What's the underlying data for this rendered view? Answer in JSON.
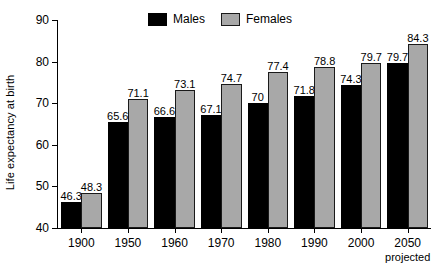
{
  "chart_data": {
    "type": "bar",
    "title": "",
    "subtitle": "",
    "xlabel": "",
    "ylabel": "Life expectancy at birth",
    "categories": [
      "1900",
      "1950",
      "1960",
      "1970",
      "1980",
      "1990",
      "2000",
      "2050"
    ],
    "category_sublabels": [
      "",
      "",
      "",
      "",
      "",
      "",
      "",
      "projected"
    ],
    "series": [
      {
        "name": "Males",
        "color": "#000000",
        "values": [
          46.3,
          65.6,
          66.6,
          67.1,
          70,
          71.8,
          74.3,
          79.7
        ],
        "labels": [
          "46.3",
          "65.6",
          "66.6",
          "67.1",
          "70",
          "71.8",
          "74.3",
          "79.7"
        ]
      },
      {
        "name": "Females",
        "color": "#a8a8a8",
        "values": [
          48.3,
          71.1,
          73.1,
          74.7,
          77.4,
          78.8,
          79.7,
          84.3
        ],
        "labels": [
          "48.3",
          "71.1",
          "73.1",
          "74.7",
          "77.4",
          "78.8",
          "79.7",
          "84.3"
        ]
      }
    ],
    "ylim": [
      40,
      90
    ],
    "yticks": [
      40,
      50,
      60,
      70,
      80,
      90
    ],
    "ytick_labels": [
      "40",
      "50",
      "60",
      "70",
      "80",
      "90"
    ],
    "grid": false,
    "legend_position": "top-center"
  },
  "legend": {
    "items": [
      {
        "label": "Males",
        "swatch": "males-swatch"
      },
      {
        "label": "Females",
        "swatch": "females-swatch"
      }
    ]
  }
}
